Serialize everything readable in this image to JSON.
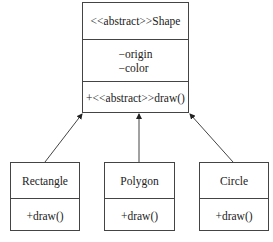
{
  "diagram": {
    "type": "uml-class-diagram",
    "parent": {
      "name": "<<abstract>>Shape",
      "attributes": [
        "−origin",
        "−color"
      ],
      "methods": [
        "+<<abstract>>draw()"
      ]
    },
    "children": [
      {
        "name": "Rectangle",
        "methods": [
          "+draw()"
        ]
      },
      {
        "name": "Polygon",
        "methods": [
          "+draw()"
        ]
      },
      {
        "name": "Circle",
        "methods": [
          "+draw()"
        ]
      }
    ],
    "relations": [
      {
        "from": "Rectangle",
        "to": "Shape",
        "type": "inheritance"
      },
      {
        "from": "Polygon",
        "to": "Shape",
        "type": "inheritance"
      },
      {
        "from": "Circle",
        "to": "Shape",
        "type": "inheritance"
      }
    ]
  }
}
